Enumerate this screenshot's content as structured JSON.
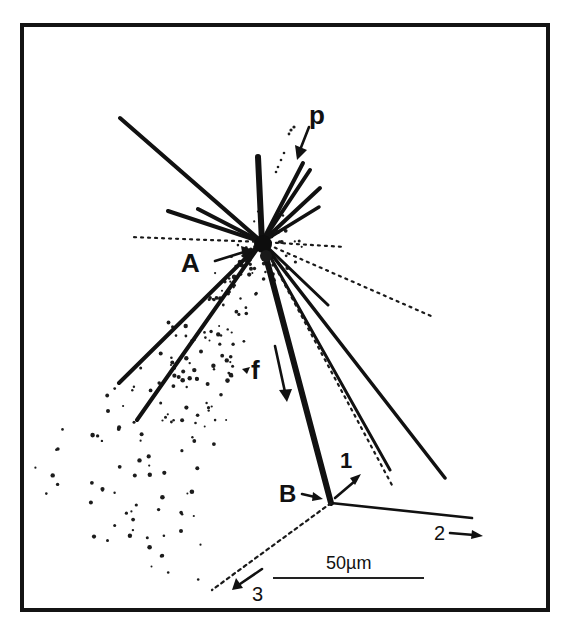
{
  "figure": {
    "title": "",
    "type": "particle track micrograph (nuclear emulsion star)",
    "frame": {
      "x": 22,
      "y": 25,
      "width": 526,
      "height": 585,
      "color": "#141414"
    },
    "labels": {
      "A": "A",
      "B": "B",
      "p": "p",
      "f": "f",
      "track1": "1",
      "track2": "2",
      "track3": "3"
    },
    "scale_bar": {
      "label": "50µm",
      "x1": 273,
      "x2": 424,
      "y": 578
    },
    "vertices": {
      "A": {
        "x": 262,
        "y": 242
      },
      "B": {
        "x": 331,
        "y": 503
      }
    },
    "tracks_from_A": [
      {
        "to": [
          120,
          118
        ],
        "width": 4
      },
      {
        "to": [
          258,
          157
        ],
        "width": 6
      },
      {
        "to": [
          168,
          211
        ],
        "width": 4
      },
      {
        "to": [
          198,
          209
        ],
        "width": 4
      },
      {
        "to": [
          303,
          163
        ],
        "width": 4
      },
      {
        "to": [
          310,
          170
        ],
        "width": 4
      },
      {
        "to": [
          320,
          188
        ],
        "width": 4
      },
      {
        "to": [
          319,
          207
        ],
        "width": 3.5
      },
      {
        "to": [
          119,
          383
        ],
        "width": 4
      },
      {
        "to": [
          137,
          420
        ],
        "width": 4
      },
      {
        "to": [
          328,
          305
        ],
        "width": 3
      },
      {
        "to": [
          445,
          478
        ],
        "width": 3.5
      },
      {
        "to": [
          390,
          470
        ],
        "width": 3
      },
      {
        "to": [
          331,
          503
        ],
        "width": 6
      }
    ],
    "dotted_from_A": [
      {
        "to": [
          130,
          237
        ]
      },
      {
        "to": [
          431,
          316
        ]
      },
      {
        "to": [
          393,
          487
        ]
      },
      {
        "to": [
          345,
          247
        ]
      }
    ],
    "tracks_from_B": [
      {
        "name": "track-2",
        "to": [
          472,
          518
        ],
        "style": "solid"
      },
      {
        "name": "track-3",
        "to": [
          212,
          590
        ],
        "style": "dotted"
      }
    ]
  }
}
